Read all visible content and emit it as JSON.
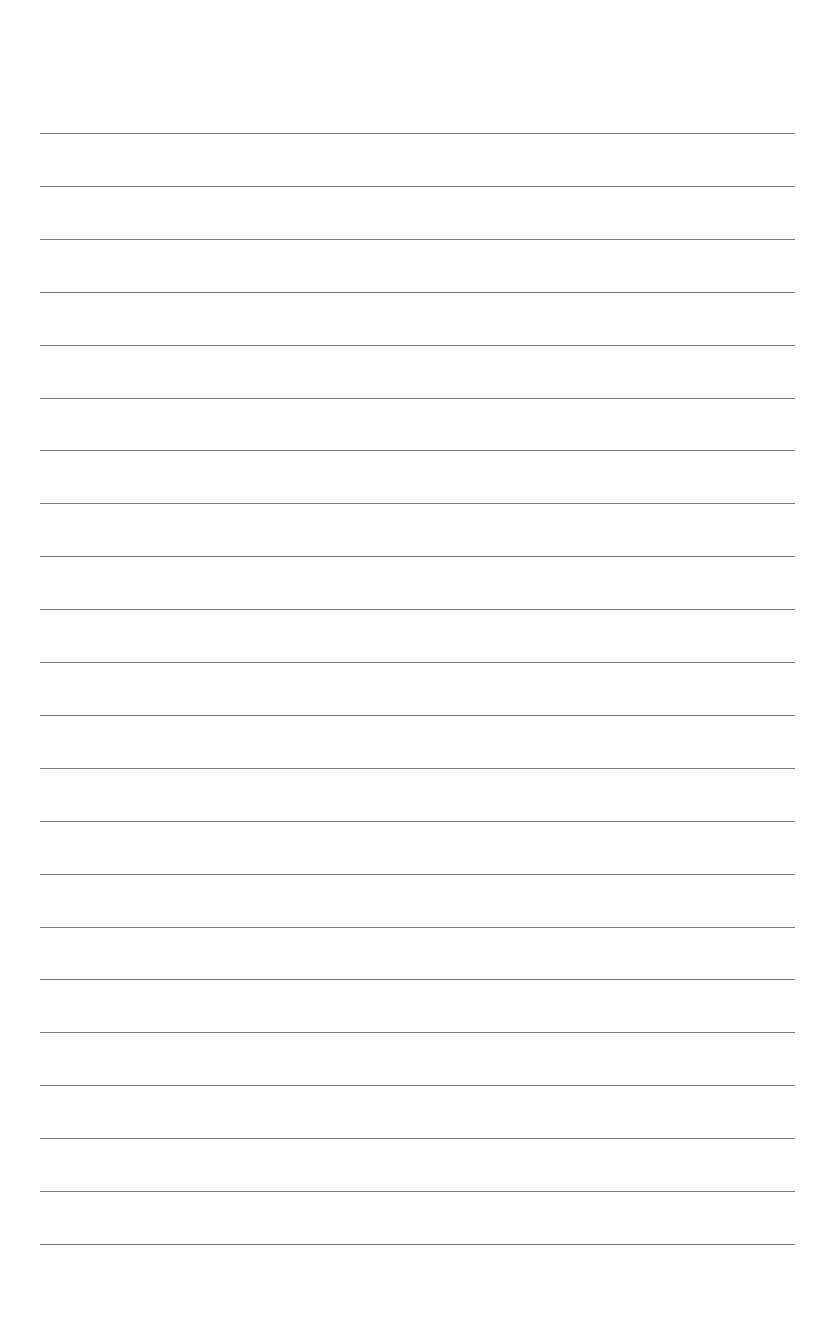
{
  "document": {
    "type": "lined-paper",
    "background_color": "#ffffff",
    "line_color": "#7d7d7d",
    "line_count": 22,
    "line_left_px": 40,
    "line_right_px": 795,
    "first_line_y_px": 133,
    "last_line_y_px": 1244,
    "line_spacing_px": 52.9,
    "text_content": ""
  }
}
